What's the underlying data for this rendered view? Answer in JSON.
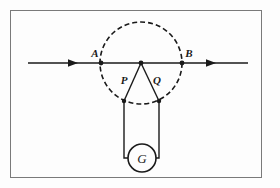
{
  "figure": {
    "background_color": "#fdfdfd",
    "frame": {
      "name": "figure-border",
      "color": "#7a7a7a",
      "x": 10,
      "y": 10,
      "width": 252,
      "height": 168
    },
    "stroke_color": "#1a1a1a",
    "labels": {
      "point_a": "A",
      "point_b": "B",
      "point_p": "P",
      "point_q": "Q",
      "meter": "G"
    },
    "field_line": {
      "name": "magnetic-field-line",
      "y": 63,
      "x_start": 28,
      "x_end": 248,
      "arrow_left_x": 78,
      "arrow_right_x": 216
    },
    "circle": {
      "name": "dashed-circle",
      "cx": 141,
      "cy": 63,
      "r": 41,
      "dash": "5 3"
    },
    "points": {
      "a": {
        "x": 101,
        "y": 63
      },
      "b": {
        "x": 182,
        "y": 63
      },
      "apex": {
        "x": 141,
        "y": 63
      },
      "p": {
        "x": 124,
        "y": 101
      },
      "q": {
        "x": 159,
        "y": 101
      }
    },
    "label_positions": {
      "a": {
        "x": 95,
        "y": 57
      },
      "b": {
        "x": 187,
        "y": 57
      },
      "p": {
        "x": 124,
        "y": 83
      },
      "q": {
        "x": 156,
        "y": 83
      },
      "g": {
        "x": 141,
        "y": 163
      }
    },
    "galvanometer": {
      "name": "galvanometer",
      "cx": 142,
      "cy": 158,
      "r": 14,
      "lead_left_x": 124,
      "lead_right_x": 159,
      "lead_top_y": 101,
      "lead_bottom_y": 158
    }
  }
}
